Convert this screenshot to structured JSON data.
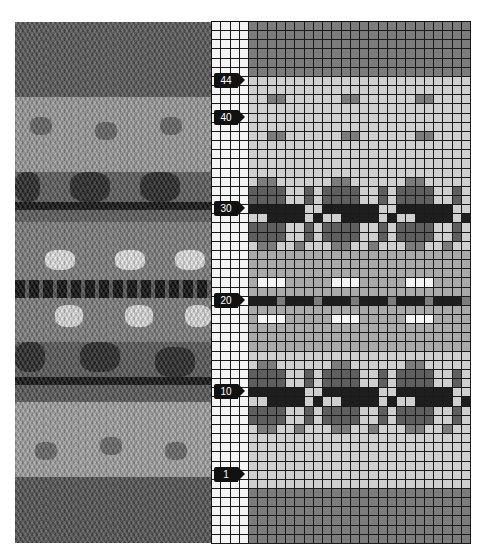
{
  "figure": {
    "photo": {
      "colors": {
        "dark_gray": "#4f4f4f",
        "mid_gray": "#7a7a7a",
        "light_gray": "#b5b5b5",
        "black": "#111111",
        "white": "#e8e8e8"
      }
    },
    "chart": {
      "columns": 28,
      "rows": 57,
      "blank_columns": 4,
      "colors": {
        "grid_line": "#1a1a1a",
        "blank": "#f4f4f4",
        "light": "#cfcfcf",
        "mid": "#a9a9a9",
        "dark": "#7c7c7c",
        "darker": "#5f5f5f",
        "black": "#1e1e1e"
      },
      "row_labels": [
        {
          "label": "44",
          "row": 44
        },
        {
          "label": "40",
          "row": 40
        },
        {
          "label": "30",
          "row": 30
        },
        {
          "label": "20",
          "row": 20
        },
        {
          "label": "10",
          "row": 10
        },
        {
          "label": "1",
          "row": 1
        }
      ]
    }
  }
}
